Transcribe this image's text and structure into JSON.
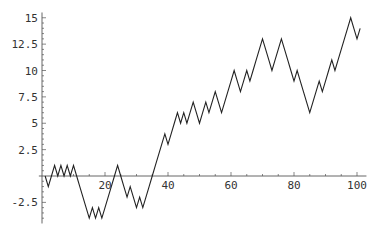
{
  "chart_data": {
    "type": "line",
    "title": "",
    "xlabel": "",
    "ylabel": "",
    "xlim": [
      0,
      103
    ],
    "ylim": [
      -4.5,
      15.5
    ],
    "grid": false,
    "legend": null,
    "x_ticks": [
      20,
      40,
      60,
      80,
      100
    ],
    "x_tick_labels": [
      "20",
      "40",
      "60",
      "80",
      "100"
    ],
    "y_ticks": [
      -2.5,
      2.5,
      5,
      7.5,
      10,
      12.5,
      15
    ],
    "y_tick_labels": [
      "-2.5",
      "2.5",
      "5",
      "7.5",
      "10",
      "12.5",
      "15"
    ],
    "x_start": 1,
    "series": [
      {
        "name": "random walk",
        "color": "#222222",
        "values": [
          0,
          -1,
          0,
          1,
          0,
          1,
          0,
          1,
          0,
          1,
          0,
          -1,
          -2,
          -3,
          -4,
          -3,
          -4,
          -3,
          -4,
          -3,
          -2,
          -1,
          0,
          1,
          0,
          -1,
          -2,
          -1,
          -2,
          -3,
          -2,
          -3,
          -2,
          -1,
          0,
          1,
          2,
          3,
          4,
          3,
          4,
          5,
          6,
          5,
          6,
          5,
          6,
          7,
          6,
          5,
          6,
          7,
          6,
          7,
          8,
          7,
          6,
          7,
          8,
          9,
          10,
          9,
          8,
          9,
          10,
          9,
          10,
          11,
          12,
          13,
          12,
          11,
          10,
          11,
          12,
          13,
          12,
          11,
          10,
          9,
          10,
          9,
          8,
          7,
          6,
          7,
          8,
          9,
          8,
          9,
          10,
          11,
          10,
          11,
          12,
          13,
          14,
          15,
          14,
          13,
          14
        ]
      }
    ]
  },
  "layout": {
    "origin_px": [
      42,
      176
    ],
    "x_px_per_unit": 3.15,
    "y_px_per_unit": 10.55
  }
}
